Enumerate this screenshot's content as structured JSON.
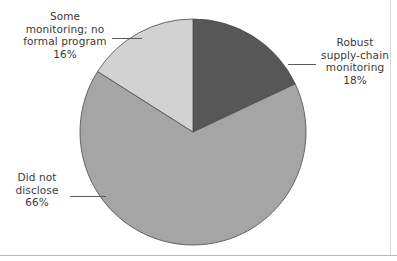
{
  "chart_data": {
    "type": "pie",
    "title": "",
    "subtitle": "",
    "xlabel": "",
    "ylabel": "",
    "legend_position": "none",
    "grid": false,
    "start_angle_deg": 90,
    "direction": "clockwise",
    "categories": [
      "Robust supply-chain monitoring",
      "Did not disclose",
      "Some monitoring; no formal program"
    ],
    "values": [
      18,
      66,
      16
    ],
    "value_suffix": "%",
    "slices": [
      {
        "id": "robust",
        "label": "Robust\nsupply-chain\nmonitoring",
        "label_text": "Robust supply-chain monitoring",
        "value": 18,
        "value_label": "18%",
        "color": "#575757",
        "start_deg": 0,
        "end_deg": 64.8
      },
      {
        "id": "did-not-disclose",
        "label": "Did not\ndisclose",
        "label_text": "Did not disclose",
        "value": 66,
        "value_label": "66%",
        "color": "#a5a5a5",
        "start_deg": 64.8,
        "end_deg": 302.4
      },
      {
        "id": "some-monitoring",
        "label": "Some\nmonitoring; no\nformal program",
        "label_text": "Some monitoring; no formal program",
        "value": 16,
        "value_label": "16%",
        "color": "#d2d2d2",
        "start_deg": 302.4,
        "end_deg": 360
      }
    ]
  },
  "annotations": {
    "some_monitoring": "Some\nmonitoring; no\nformal program\n16%",
    "robust": "Robust\nsupply-chain\nmonitoring\n18%",
    "did_not_disclose": "Did not\ndisclose\n66%"
  },
  "style": {
    "background": "#ffffff",
    "text_color": "#3a3a3a",
    "leader_color": "#5a5a5a",
    "slice_edge_color": "#4a4a4a",
    "frame_color": "#b9b9b9"
  },
  "geometry": {
    "center_x": 193,
    "center_y": 132,
    "radius": 113
  }
}
